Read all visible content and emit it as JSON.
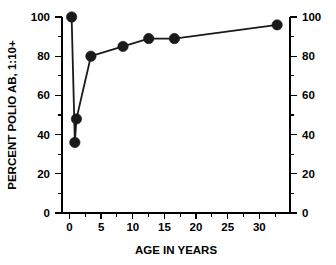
{
  "chart_data": {
    "type": "line",
    "title": "",
    "xlabel": "AGE IN YEARS",
    "ylabel": "PERCENT POLIO AB, 1:10+",
    "ylabel_right": "",
    "xlim": [
      -1.5,
      34
    ],
    "ylim": [
      0,
      100
    ],
    "grid": false,
    "legend": "none",
    "x_ticks": [
      0,
      5,
      10,
      15,
      20,
      25,
      30
    ],
    "x_tick_labels": [
      "0",
      "5",
      "10",
      "15",
      "20",
      "25",
      "30"
    ],
    "x_minor_ticks": [
      2.5,
      7.5,
      12.5,
      17.5,
      22.5,
      27.5,
      32.5
    ],
    "y_ticks": [
      0,
      20,
      40,
      60,
      80,
      100
    ],
    "y_tick_labels": [
      "0",
      "20",
      "40",
      "60",
      "80",
      "100"
    ],
    "y_tick_labels_right": [
      "0",
      "20",
      "40",
      "60",
      "80",
      "100"
    ],
    "y_minor_ticks": [
      10,
      30,
      50,
      70,
      90
    ],
    "series": [
      {
        "name": "percent polio antibody",
        "marker": "filled-circle",
        "color": "#1a1a1a",
        "x": [
          0,
          0.5,
          0.75,
          3,
          8,
          12,
          16,
          32
        ],
        "y": [
          100,
          36,
          48,
          80,
          85,
          89,
          89,
          96
        ]
      }
    ]
  },
  "axes": {
    "left_axis_name": "left-value-axis",
    "right_axis_name": "right-value-axis",
    "bottom_axis_name": "age-axis"
  }
}
